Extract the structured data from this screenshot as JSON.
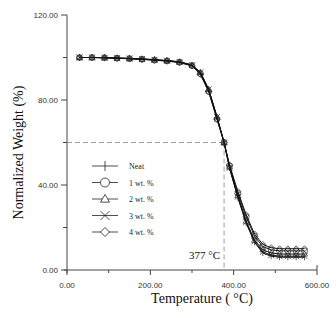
{
  "chart_data": {
    "type": "line",
    "title": "",
    "xlabel": "Temperature ( °C)",
    "ylabel": "Normalized Weight (%)",
    "xlim": [
      0,
      600
    ],
    "ylim": [
      0,
      120
    ],
    "x_ticks": [
      "0.00",
      "200.00",
      "400.00",
      "600.00"
    ],
    "y_ticks": [
      "0.00",
      "40.00",
      "80.00",
      "120.00"
    ],
    "grid": false,
    "legend_position": "inside-left-middle",
    "annotation": {
      "text": "377",
      "unit": "°C",
      "x": 377,
      "y": 60
    },
    "x": [
      30,
      60,
      90,
      120,
      150,
      180,
      210,
      240,
      270,
      300,
      320,
      340,
      360,
      377,
      390,
      410,
      430,
      450,
      470,
      490,
      510,
      530,
      550,
      570
    ],
    "series": [
      {
        "name": "Neat",
        "marker": "plus",
        "values": [
          100,
          100,
          100,
          99.8,
          99.6,
          99.4,
          99,
          98.6,
          98,
          96.5,
          93,
          85,
          72,
          60,
          48,
          34,
          22,
          13,
          8,
          6.5,
          6,
          6,
          6,
          6
        ]
      },
      {
        "name": "1 wt. %",
        "marker": "circle",
        "values": [
          100,
          100,
          99.9,
          99.7,
          99.5,
          99.2,
          98.8,
          98.4,
          97.8,
          96.2,
          92.5,
          84,
          71,
          60,
          49,
          36,
          25,
          16,
          11,
          9.5,
          9,
          9,
          9,
          9
        ]
      },
      {
        "name": "2 wt. %",
        "marker": "triangle",
        "values": [
          100,
          100,
          99.9,
          99.7,
          99.5,
          99.2,
          98.9,
          98.5,
          97.9,
          96.4,
          93,
          85,
          72,
          60,
          48.5,
          35,
          23,
          14,
          9.5,
          8,
          7.5,
          7.5,
          7.5,
          7.5
        ]
      },
      {
        "name": "3 wt. %",
        "marker": "cross",
        "values": [
          100,
          100,
          99.9,
          99.7,
          99.5,
          99.3,
          98.9,
          98.5,
          97.9,
          96.4,
          93,
          85,
          72,
          60,
          48,
          34.5,
          22.5,
          13.5,
          8.5,
          7,
          6.5,
          6.5,
          6.5,
          6.5
        ]
      },
      {
        "name": "4 wt. %",
        "marker": "diamond",
        "values": [
          100,
          100,
          99.9,
          99.6,
          99.4,
          99.1,
          98.7,
          98.3,
          97.6,
          96,
          92,
          84,
          71,
          60,
          49.5,
          37,
          26,
          17,
          12,
          10.5,
          10,
          10,
          10,
          10
        ]
      }
    ]
  },
  "labels": {
    "xlabel": "Temperature ( °C)",
    "ylabel": "Normalized Weight (%)",
    "annotation": "377 °C"
  }
}
